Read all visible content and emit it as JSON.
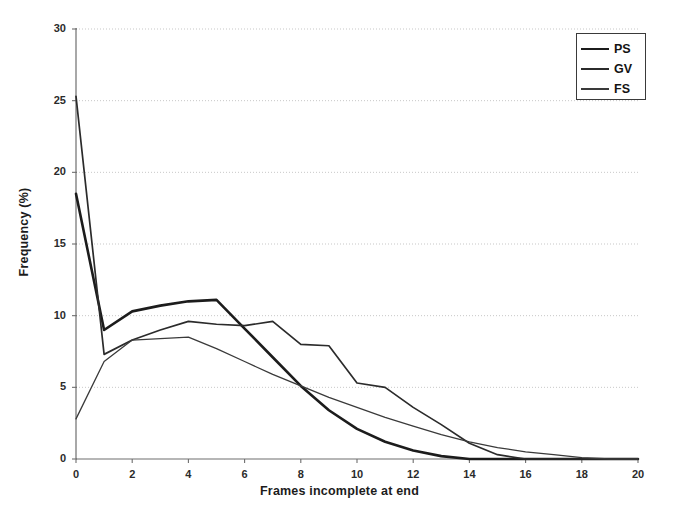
{
  "chart_data": {
    "type": "line",
    "title": "",
    "xlabel": "Frames incomplete at end",
    "ylabel": "Frequency (%)",
    "xlim": [
      0,
      20
    ],
    "ylim": [
      0,
      30
    ],
    "xticks": [
      0,
      2,
      4,
      6,
      8,
      10,
      12,
      14,
      16,
      18,
      20
    ],
    "yticks": [
      0,
      5,
      10,
      15,
      20,
      25,
      30
    ],
    "xtick_labels": [
      "0",
      "2",
      "4",
      "6",
      "8",
      "10",
      "12",
      "14",
      "16",
      "18",
      "20"
    ],
    "ytick_labels": [
      "0",
      "5",
      "10",
      "15",
      "20",
      "25",
      "30"
    ],
    "grid": "horizontal",
    "legend_position": "top-right",
    "x": [
      0,
      1,
      2,
      3,
      4,
      5,
      6,
      7,
      8,
      9,
      10,
      11,
      12,
      13,
      14,
      15,
      16,
      17,
      18,
      19,
      20
    ],
    "series": [
      {
        "name": "PS",
        "color": "#1c1c1c",
        "line_width": 2.6,
        "values": [
          18.5,
          9.0,
          10.3,
          10.7,
          11.0,
          11.1,
          9.1,
          7.1,
          5.1,
          3.4,
          2.1,
          1.2,
          0.6,
          0.2,
          0.0,
          0.0,
          0.0,
          0.0,
          0.0,
          0.0,
          0.0
        ]
      },
      {
        "name": "GV",
        "color": "#2b2b2b",
        "line_width": 1.7,
        "values": [
          25.3,
          7.3,
          8.3,
          9.0,
          9.6,
          9.4,
          9.3,
          9.6,
          8.0,
          7.9,
          5.3,
          5.0,
          3.6,
          2.4,
          1.1,
          0.3,
          0.0,
          0.0,
          0.0,
          0.0,
          0.0
        ]
      },
      {
        "name": "FS",
        "color": "#3a3a3a",
        "line_width": 1.3,
        "values": [
          2.8,
          6.8,
          8.3,
          8.4,
          8.5,
          7.7,
          6.8,
          5.9,
          5.1,
          4.3,
          3.6,
          2.9,
          2.3,
          1.7,
          1.2,
          0.8,
          0.5,
          0.3,
          0.1,
          0.0,
          0.0
        ]
      }
    ]
  },
  "legend": {
    "items": [
      {
        "label": "PS"
      },
      {
        "label": "GV"
      },
      {
        "label": "FS"
      }
    ]
  }
}
